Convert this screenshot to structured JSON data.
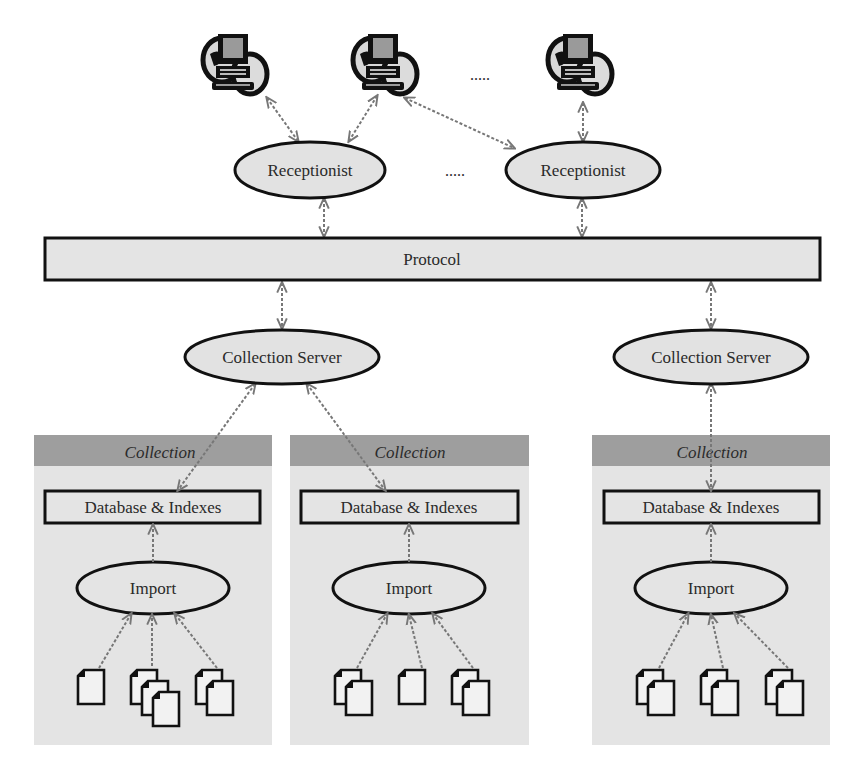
{
  "diagram": {
    "type": "architecture",
    "clients": [
      {
        "id": "client-1",
        "icon": "networked-computer-icon"
      },
      {
        "id": "client-2",
        "icon": "networked-computer-icon"
      },
      {
        "id": "client-3",
        "icon": "networked-computer-icon"
      }
    ],
    "client_ellipsis": ".....",
    "receptionists": [
      {
        "id": "receptionist-1",
        "label": "Receptionist"
      },
      {
        "id": "receptionist-2",
        "label": "Receptionist"
      }
    ],
    "receptionist_ellipsis": ".....",
    "protocol": {
      "label": "Protocol"
    },
    "collection_servers": [
      {
        "id": "collection-server-1",
        "label": "Collection Server"
      },
      {
        "id": "collection-server-2",
        "label": "Collection Server"
      }
    ],
    "collections": [
      {
        "id": "collection-1",
        "header": "Collection",
        "database_label": "Database & Indexes",
        "import_label": "Import",
        "document_stacks": [
          1,
          3,
          2
        ]
      },
      {
        "id": "collection-2",
        "header": "Collection",
        "database_label": "Database & Indexes",
        "import_label": "Import",
        "document_stacks": [
          2,
          1,
          2
        ]
      },
      {
        "id": "collection-3",
        "header": "Collection",
        "database_label": "Database & Indexes",
        "import_label": "Import",
        "document_stacks": [
          2,
          2,
          2
        ]
      }
    ],
    "connections": [
      {
        "from": "client-1",
        "to": "receptionist-1"
      },
      {
        "from": "client-2",
        "to": "receptionist-1"
      },
      {
        "from": "client-2",
        "to": "receptionist-2"
      },
      {
        "from": "client-3",
        "to": "receptionist-2"
      },
      {
        "from": "receptionist-1",
        "to": "protocol"
      },
      {
        "from": "receptionist-2",
        "to": "protocol"
      },
      {
        "from": "protocol",
        "to": "collection-server-1"
      },
      {
        "from": "protocol",
        "to": "collection-server-2"
      },
      {
        "from": "collection-server-1",
        "to": "collection-1"
      },
      {
        "from": "collection-server-1",
        "to": "collection-2"
      },
      {
        "from": "collection-server-2",
        "to": "collection-3"
      }
    ],
    "colors": {
      "node_fill": "#e2e2e2",
      "panel_fill": "#e4e4e4",
      "panel_header": "#9e9e9e",
      "stroke": "#111111",
      "connector": "#777777"
    }
  }
}
